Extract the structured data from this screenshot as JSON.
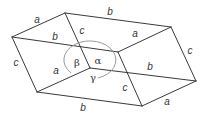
{
  "figure": {
    "colors": {
      "edge": "#3a3a3a",
      "arc": "#9a9a9a",
      "label": "#333333"
    },
    "vertices": {
      "top_back": [
        65,
        13
      ],
      "left": [
        12,
        37
      ],
      "top_right": [
        171,
        27
      ],
      "top_front": [
        118,
        52
      ],
      "origin": [
        90,
        68
      ],
      "bottom_left": [
        37,
        92
      ],
      "bottom_front": [
        142,
        106
      ],
      "bottom_right": [
        196,
        81
      ]
    },
    "edges": [
      {
        "id": "e1",
        "from": "left",
        "to": "top_back"
      },
      {
        "id": "e2",
        "from": "top_back",
        "to": "top_right"
      },
      {
        "id": "e3",
        "from": "left",
        "to": "top_front"
      },
      {
        "id": "e4",
        "from": "top_front",
        "to": "top_right"
      },
      {
        "id": "e5",
        "from": "top_back",
        "to": "origin"
      },
      {
        "id": "e6",
        "from": "left",
        "to": "bottom_left"
      },
      {
        "id": "e7",
        "from": "top_right",
        "to": "bottom_right"
      },
      {
        "id": "e8",
        "from": "top_front",
        "to": "bottom_front"
      },
      {
        "id": "e9",
        "from": "origin",
        "to": "bottom_left"
      },
      {
        "id": "e10",
        "from": "origin",
        "to": "bottom_right"
      },
      {
        "id": "e11",
        "from": "bottom_left",
        "to": "bottom_front"
      },
      {
        "id": "e12",
        "from": "bottom_front",
        "to": "bottom_right"
      }
    ],
    "edge_labels": [
      {
        "text": "a",
        "x": 37,
        "y": 20
      },
      {
        "text": "b",
        "x": 110,
        "y": 12
      },
      {
        "text": "b",
        "x": 55,
        "y": 37
      },
      {
        "text": "c",
        "x": 82,
        "y": 31
      },
      {
        "text": "a",
        "x": 135,
        "y": 34
      },
      {
        "text": "c",
        "x": 16,
        "y": 63
      },
      {
        "text": "c",
        "x": 190,
        "y": 51
      },
      {
        "text": "a",
        "x": 56,
        "y": 71
      },
      {
        "text": "b",
        "x": 150,
        "y": 67
      },
      {
        "text": "c",
        "x": 125,
        "y": 88
      },
      {
        "text": "b",
        "x": 83,
        "y": 108
      },
      {
        "text": "a",
        "x": 167,
        "y": 102
      }
    ],
    "angle_labels": [
      {
        "text": "β",
        "name": "beta",
        "x": 77,
        "y": 63
      },
      {
        "text": "α",
        "name": "alpha",
        "x": 98,
        "y": 61
      },
      {
        "text": "γ",
        "name": "gamma",
        "x": 93,
        "y": 78
      }
    ],
    "angle_arc": {
      "cx": 90,
      "cy": 60,
      "rx": 26,
      "ry": 19,
      "start": [
        71,
        73
      ],
      "end": [
        98,
        78
      ]
    }
  }
}
